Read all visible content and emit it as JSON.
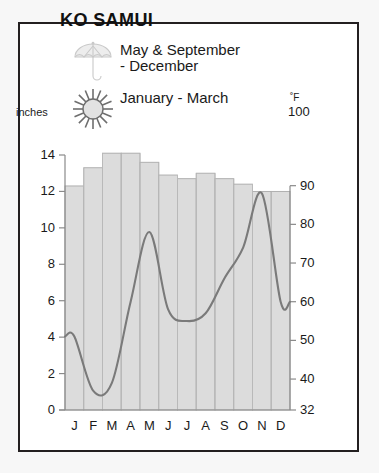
{
  "title": "KO SAMUI",
  "legend": [
    {
      "icon": "umbrella-icon",
      "label": "May & September\n- December"
    },
    {
      "icon": "sun-icon",
      "label": "January - March"
    }
  ],
  "axes": {
    "left_title": "inches",
    "right_title": "˚F",
    "right_top_value": "100"
  },
  "colors": {
    "frame": "#231f20",
    "bar_fill": "#dcdcdc",
    "bar_stroke": "#a9a9a9",
    "gridline": "#bdbdbd",
    "line": "#7a7a7a",
    "text": "#1a1a1a"
  },
  "chart_data": {
    "type": "bar",
    "title": "KO SAMUI",
    "xlabel": "",
    "ylabel": "inches",
    "y2label": "˚F",
    "grid": true,
    "legend_position": "top",
    "categories": [
      "J",
      "F",
      "M",
      "A",
      "M",
      "J",
      "J",
      "A",
      "S",
      "O",
      "N",
      "D"
    ],
    "month_names": [
      "January",
      "February",
      "March",
      "April",
      "May",
      "June",
      "July",
      "August",
      "September",
      "October",
      "November",
      "December"
    ],
    "ylim": [
      0,
      14
    ],
    "yticks": [
      0,
      2,
      4,
      6,
      8,
      10,
      12,
      14
    ],
    "ytick_labels": [
      "0",
      "2",
      "4",
      "6",
      "8",
      "10",
      "12",
      "14"
    ],
    "y2lim": [
      32,
      100
    ],
    "y2ticks": [
      32,
      40,
      50,
      60,
      70,
      80,
      90,
      100
    ],
    "y2tick_labels": [
      "32",
      "40",
      "50",
      "60",
      "70",
      "80",
      "90",
      "100"
    ],
    "series": [
      {
        "name": "Precipitation",
        "type": "bar",
        "axis": "left",
        "unit": "inches",
        "values": [
          12.3,
          13.3,
          14.1,
          14.1,
          13.6,
          12.9,
          12.7,
          13.0,
          12.7,
          12.4,
          12.0,
          12.0
        ]
      },
      {
        "name": "Temperature",
        "type": "line",
        "axis": "right",
        "unit": "˚F",
        "values": [
          51,
          37,
          39,
          60,
          78,
          58,
          55,
          57,
          66,
          74,
          88,
          60
        ]
      }
    ]
  }
}
